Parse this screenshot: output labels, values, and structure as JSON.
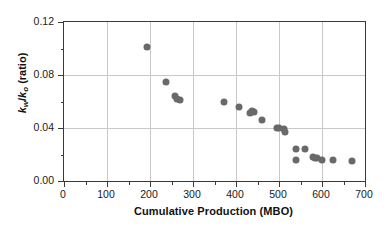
{
  "chart_data": {
    "type": "scatter",
    "title": "",
    "xlabel": "Cumulative Production (MBO)",
    "ylabel": "kw/ko (ratio)",
    "ylabel_parts": {
      "k1": "k",
      "sub1": "w",
      "slash": "/",
      "k2": "k",
      "sub2": "o",
      "unit": " (ratio)"
    },
    "xlim": [
      0,
      700
    ],
    "ylim": [
      0.0,
      0.12
    ],
    "xticks": [
      0,
      100,
      200,
      300,
      400,
      500,
      600,
      700
    ],
    "xtick_labels": [
      "0",
      "100",
      "200",
      "300",
      "400",
      "500",
      "600",
      "700"
    ],
    "yticks": [
      0.0,
      0.04,
      0.08,
      0.12
    ],
    "ytick_labels": [
      "0.00",
      "0.04",
      "0.08",
      "0.12"
    ],
    "x_minor_interval": 50,
    "y_minor_interval": 0.02,
    "grid": "both",
    "grid_color": "#c8c8c8",
    "marker_color": "#696969",
    "marker_size": 7,
    "legend": null,
    "points": [
      {
        "x": 192,
        "y": 0.101
      },
      {
        "x": 237,
        "y": 0.075
      },
      {
        "x": 259,
        "y": 0.064
      },
      {
        "x": 263,
        "y": 0.062
      },
      {
        "x": 270,
        "y": 0.061
      },
      {
        "x": 371,
        "y": 0.06
      },
      {
        "x": 406,
        "y": 0.056
      },
      {
        "x": 432,
        "y": 0.051
      },
      {
        "x": 437,
        "y": 0.053
      },
      {
        "x": 441,
        "y": 0.052
      },
      {
        "x": 461,
        "y": 0.046
      },
      {
        "x": 496,
        "y": 0.04
      },
      {
        "x": 501,
        "y": 0.04
      },
      {
        "x": 511,
        "y": 0.039
      },
      {
        "x": 514,
        "y": 0.037
      },
      {
        "x": 539,
        "y": 0.024
      },
      {
        "x": 540,
        "y": 0.016
      },
      {
        "x": 560,
        "y": 0.024
      },
      {
        "x": 578,
        "y": 0.018
      },
      {
        "x": 583,
        "y": 0.017
      },
      {
        "x": 588,
        "y": 0.017
      },
      {
        "x": 601,
        "y": 0.016
      },
      {
        "x": 625,
        "y": 0.016
      },
      {
        "x": 670,
        "y": 0.015
      }
    ]
  }
}
